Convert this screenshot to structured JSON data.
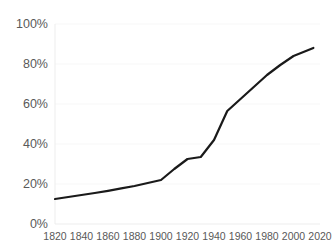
{
  "chart_data": {
    "type": "line",
    "title": "",
    "subtitle": "",
    "xlabel": "",
    "ylabel": "",
    "xlim": [
      1820,
      2020
    ],
    "ylim": [
      0,
      100
    ],
    "grid": true,
    "grid_axis": "y",
    "legend": false,
    "legend_position": "none",
    "xticks": [
      1820,
      1840,
      1860,
      1880,
      1900,
      1920,
      1940,
      1960,
      1980,
      2000,
      2020
    ],
    "xtick_labels": [
      "1820",
      "1840",
      "1860",
      "1880",
      "1900",
      "1920",
      "1940",
      "1960",
      "1980",
      "2000",
      "2020"
    ],
    "yticks": [
      0,
      20,
      40,
      60,
      80,
      100
    ],
    "ytick_labels": [
      "0%",
      "20%",
      "40%",
      "60%",
      "80%",
      "100%"
    ],
    "x": [
      1820,
      1830,
      1840,
      1850,
      1860,
      1870,
      1880,
      1890,
      1900,
      1910,
      1920,
      1930,
      1940,
      1950,
      1960,
      1970,
      1980,
      1990,
      2000,
      2015
    ],
    "series": [
      {
        "name": "value",
        "color": "#1a1a1a",
        "line_width": 2.2,
        "values": [
          12.5,
          13.5,
          14.5,
          15.5,
          16.6,
          17.8,
          19.0,
          20.5,
          22.0,
          27.5,
          32.5,
          33.5,
          42.0,
          56.5,
          62.5,
          68.5,
          74.5,
          79.5,
          84.0,
          88.0
        ]
      }
    ]
  },
  "axis_style": {
    "tick_label_color": "#595959",
    "grid_color": "#f7f7f7",
    "axis_line_color": "#ededed",
    "background": "#ffffff"
  }
}
